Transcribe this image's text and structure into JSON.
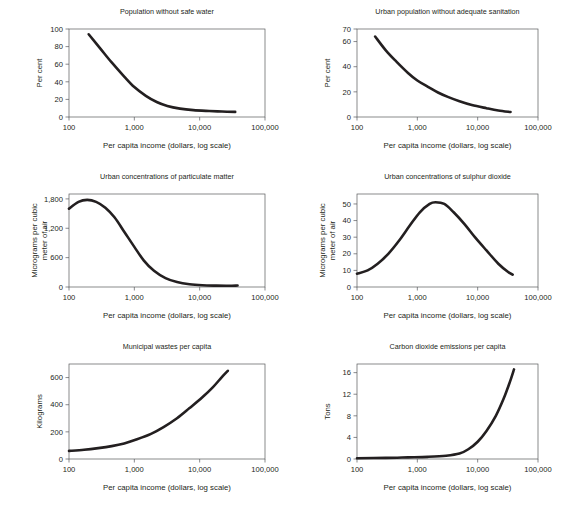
{
  "figure": {
    "name": "environmental-indicators-vs-income",
    "background_color": "#ffffff",
    "curve_color": "#231f20",
    "axis_color": "#58595b",
    "shared_xlabel": "Per capita income (dollars, log scale)",
    "shared_x_ticks": [
      "100",
      "1,000",
      "10,000",
      "100,000"
    ]
  },
  "chart_data": [
    {
      "type": "line",
      "title": "Population without safe water",
      "xlabel": "Per capita income (dollars, log scale)",
      "ylabel": "Per cent",
      "xscale": "log",
      "xlim": [
        100,
        100000
      ],
      "ylim": [
        0,
        100
      ],
      "xticks": [
        100,
        1000,
        10000,
        100000
      ],
      "xticklabels": [
        "100",
        "1,000",
        "10,000",
        "100,000"
      ],
      "yticks": [
        0,
        20,
        40,
        60,
        80,
        100
      ],
      "yticklabels": [
        "0",
        "20",
        "40",
        "60",
        "80",
        "100"
      ],
      "grid": false,
      "legend": "none",
      "x": [
        200,
        300,
        450,
        700,
        1000,
        1500,
        2200,
        3200,
        5000,
        8000,
        14000,
        22000,
        35000
      ],
      "values": [
        94,
        78,
        62,
        46,
        34,
        24,
        17,
        12.5,
        9.5,
        7.8,
        6.8,
        6.2,
        5.8
      ]
    },
    {
      "type": "line",
      "title": "Urban population without adequate sanitation",
      "xlabel": "Per capita income (dollars, log scale)",
      "ylabel": "Per cent",
      "xscale": "log",
      "xlim": [
        100,
        100000
      ],
      "ylim": [
        0,
        70
      ],
      "xticks": [
        100,
        1000,
        10000,
        100000
      ],
      "xticklabels": [
        "100",
        "1,000",
        "10,000",
        "100,000"
      ],
      "yticks": [
        0,
        20,
        40,
        60,
        70
      ],
      "yticklabels": [
        "0",
        "20",
        "40",
        "60",
        "70"
      ],
      "grid": false,
      "legend": "none",
      "x": [
        200,
        300,
        450,
        700,
        1000,
        1500,
        2200,
        3200,
        5000,
        8000,
        14000,
        22000,
        35000
      ],
      "values": [
        64,
        53,
        44,
        35,
        29,
        24,
        19.5,
        16,
        12.5,
        9.5,
        7,
        5.2,
        4
      ]
    },
    {
      "type": "line",
      "title": "Urban concentrations of particulate matter",
      "xlabel": "Per capita income (dollars, log scale)",
      "ylabel": "Micrograms per cubic meter of air",
      "ylabel_lines": [
        "Micrograms per cubic",
        "meter of air"
      ],
      "xscale": "log",
      "xlim": [
        100,
        100000
      ],
      "ylim": [
        0,
        1900
      ],
      "xticks": [
        100,
        1000,
        10000,
        100000
      ],
      "xticklabels": [
        "100",
        "1,000",
        "10,000",
        "100,000"
      ],
      "yticks": [
        0,
        600,
        1200,
        1800
      ],
      "yticklabels": [
        "0",
        "600",
        "1,200",
        "1,800"
      ],
      "grid": false,
      "legend": "none",
      "x": [
        100,
        140,
        190,
        260,
        360,
        500,
        700,
        1000,
        1400,
        2000,
        3000,
        4500,
        7000,
        11000,
        18000,
        28000,
        38000
      ],
      "values": [
        1600,
        1740,
        1780,
        1740,
        1620,
        1420,
        1130,
        820,
        540,
        330,
        180,
        100,
        55,
        35,
        28,
        25,
        30
      ]
    },
    {
      "type": "line",
      "title": "Urban concentrations of sulphur dioxide",
      "xlabel": "Per capita income (dollars, log scale)",
      "ylabel": "Micrograms per cubic meter of air",
      "ylabel_lines": [
        "Micrograms per cubic",
        "meter of air"
      ],
      "xscale": "log",
      "xlim": [
        100,
        100000
      ],
      "ylim": [
        0,
        56
      ],
      "xticks": [
        100,
        1000,
        10000,
        100000
      ],
      "xticklabels": [
        "100",
        "1,000",
        "10,000",
        "100,000"
      ],
      "yticks": [
        0,
        10,
        20,
        30,
        40,
        50
      ],
      "yticklabels": [
        "0",
        "10",
        "20",
        "30",
        "40",
        "50"
      ],
      "grid": false,
      "legend": "none",
      "x": [
        100,
        150,
        220,
        330,
        500,
        750,
        1100,
        1600,
        2000,
        2800,
        4000,
        6000,
        9000,
        14000,
        22000,
        32000,
        38000
      ],
      "values": [
        8,
        10,
        14,
        20,
        28,
        37,
        45,
        50,
        51,
        50,
        45,
        38,
        30,
        22,
        14,
        9,
        7.5
      ]
    },
    {
      "type": "line",
      "title": "Municipal wastes per capita",
      "xlabel": "Per capita income (dollars, log scale)",
      "ylabel": "Kilograms",
      "xscale": "log",
      "xlim": [
        100,
        100000
      ],
      "ylim": [
        0,
        700
      ],
      "xticks": [
        100,
        1000,
        10000,
        100000
      ],
      "xticklabels": [
        "100",
        "1,000",
        "10,000",
        "100,000"
      ],
      "yticks": [
        0,
        200,
        400,
        600
      ],
      "yticklabels": [
        "0",
        "200",
        "400",
        "600"
      ],
      "grid": false,
      "legend": "none",
      "x": [
        100,
        170,
        280,
        450,
        700,
        1100,
        1800,
        2800,
        4500,
        7000,
        11000,
        16000,
        22000,
        27000
      ],
      "values": [
        60,
        68,
        80,
        95,
        115,
        145,
        185,
        235,
        300,
        375,
        455,
        530,
        605,
        650
      ]
    },
    {
      "type": "line",
      "title": "Carbon dioxide emissions per capita",
      "xlabel": "Per capita income (dollars, log scale)",
      "ylabel": "Tons",
      "xscale": "log",
      "xlim": [
        100,
        100000
      ],
      "ylim": [
        0,
        17.6
      ],
      "xticks": [
        100,
        1000,
        10000,
        100000
      ],
      "xticklabels": [
        "100",
        "1,000",
        "10,000",
        "100,000"
      ],
      "yticks": [
        0,
        4,
        8,
        12,
        16
      ],
      "yticklabels": [
        "0",
        "4",
        "8",
        "12",
        "16"
      ],
      "grid": false,
      "legend": "none",
      "x": [
        100,
        300,
        700,
        1500,
        3000,
        5000,
        7000,
        10000,
        14000,
        20000,
        27000,
        34000,
        40000
      ],
      "values": [
        0.15,
        0.2,
        0.3,
        0.4,
        0.6,
        1.0,
        1.8,
        3.2,
        5.2,
        8.0,
        11.2,
        14.2,
        16.6
      ]
    }
  ]
}
